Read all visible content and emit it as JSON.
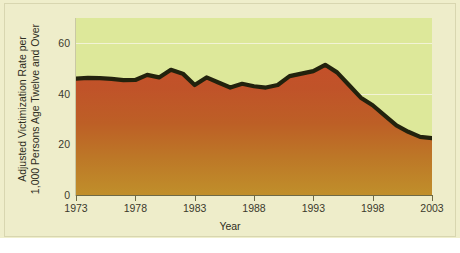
{
  "chart_data": {
    "type": "area",
    "title": "",
    "xlabel": "Year",
    "ylabel_line1": "Adjusted Victimization Rate per",
    "ylabel_line2": "1,000 Persons Age Twelve and Over",
    "xlim": [
      1973,
      2003
    ],
    "ylim": [
      0,
      70
    ],
    "xticks": [
      1973,
      1978,
      1983,
      1988,
      1993,
      1998,
      2003
    ],
    "yticks": [
      0,
      20,
      40,
      60
    ],
    "ytick_labels": [
      "0",
      "20",
      "40",
      "60"
    ],
    "xtick_labels": [
      "1973",
      "1978",
      "1983",
      "1988",
      "1993",
      "1998",
      "2003"
    ],
    "grid": true,
    "legend": "none",
    "x": [
      1973,
      1974,
      1975,
      1976,
      1977,
      1978,
      1979,
      1980,
      1981,
      1982,
      1983,
      1984,
      1985,
      1986,
      1987,
      1988,
      1989,
      1990,
      1991,
      1992,
      1993,
      1994,
      1995,
      1996,
      1997,
      1998,
      1999,
      2000,
      2001,
      2002,
      2003
    ],
    "values": [
      46.0,
      46.3,
      46.2,
      45.9,
      45.4,
      45.5,
      47.5,
      46.5,
      49.5,
      48.0,
      43.5,
      46.5,
      44.5,
      42.5,
      44.0,
      43.0,
      42.5,
      43.5,
      47.0,
      48.0,
      49.0,
      51.5,
      48.5,
      43.5,
      38.5,
      35.5,
      31.5,
      27.5,
      25.0,
      23.0,
      22.5
    ],
    "colors": {
      "plot_background": "#dde89a",
      "figure_background": "#eeedca",
      "area_top": "#c0522d",
      "area_bottom": "#c08a2a",
      "line": "#22220d",
      "gridline": "#f2f3d6",
      "axis": "#6e6a46",
      "text": "#2f2e22"
    }
  }
}
